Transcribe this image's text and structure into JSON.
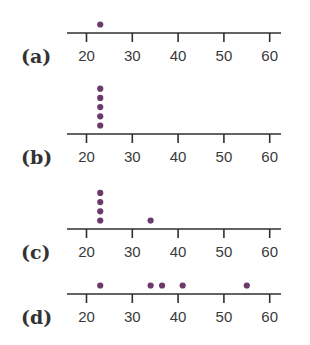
{
  "chart_data": [
    {
      "type": "scatter",
      "subtype": "dot-plot",
      "label": "(a)",
      "title": "",
      "xlabel": "",
      "ylabel": "",
      "xlim": [
        20,
        60
      ],
      "ticks": [
        20,
        30,
        40,
        50,
        60
      ],
      "tick_labels": [
        "20",
        "30",
        "40",
        "50",
        "60"
      ],
      "grid": false,
      "values": [
        23
      ],
      "stacks": [
        {
          "x": 23,
          "count": 1
        }
      ]
    },
    {
      "type": "scatter",
      "subtype": "dot-plot",
      "label": "(b)",
      "title": "",
      "xlabel": "",
      "ylabel": "",
      "xlim": [
        20,
        60
      ],
      "ticks": [
        20,
        30,
        40,
        50,
        60
      ],
      "tick_labels": [
        "20",
        "30",
        "40",
        "50",
        "60"
      ],
      "grid": false,
      "values": [
        23,
        23,
        23,
        23,
        23
      ],
      "stacks": [
        {
          "x": 23,
          "count": 5
        }
      ]
    },
    {
      "type": "scatter",
      "subtype": "dot-plot",
      "label": "(c)",
      "title": "",
      "xlabel": "",
      "ylabel": "",
      "xlim": [
        20,
        60
      ],
      "ticks": [
        20,
        30,
        40,
        50,
        60
      ],
      "tick_labels": [
        "20",
        "30",
        "40",
        "50",
        "60"
      ],
      "grid": false,
      "values": [
        23,
        23,
        23,
        23,
        34
      ],
      "stacks": [
        {
          "x": 23,
          "count": 4
        },
        {
          "x": 34,
          "count": 1
        }
      ]
    },
    {
      "type": "scatter",
      "subtype": "dot-plot",
      "label": "(d)",
      "title": "",
      "xlabel": "",
      "ylabel": "",
      "xlim": [
        20,
        60
      ],
      "ticks": [
        20,
        30,
        40,
        50,
        60
      ],
      "tick_labels": [
        "20",
        "30",
        "40",
        "50",
        "60"
      ],
      "grid": false,
      "values": [
        23,
        34,
        36.5,
        41,
        55
      ],
      "stacks": [
        {
          "x": 23,
          "count": 1
        },
        {
          "x": 34,
          "count": 1
        },
        {
          "x": 36.5,
          "count": 1
        },
        {
          "x": 41,
          "count": 1
        },
        {
          "x": 55,
          "count": 1
        }
      ]
    }
  ],
  "style": {
    "dot_color": "#6b3a6b",
    "axis_color": "#2f2f2f",
    "text_color": "#333333"
  },
  "layout": {
    "axis_y": [
      33,
      134,
      229,
      294
    ],
    "x_px_per_unit": 4.58,
    "x_origin_px": 86.5,
    "axis_x_start": 67,
    "axis_x_end": 281,
    "dot_radius": 3.1,
    "dot_gap": 9.2
  }
}
